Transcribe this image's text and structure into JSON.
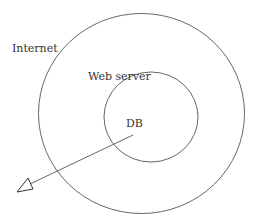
{
  "diagram": {
    "labels": {
      "outer": "Internet",
      "inner": "Web server",
      "center": "DB"
    },
    "stroke_color": "#555555"
  }
}
